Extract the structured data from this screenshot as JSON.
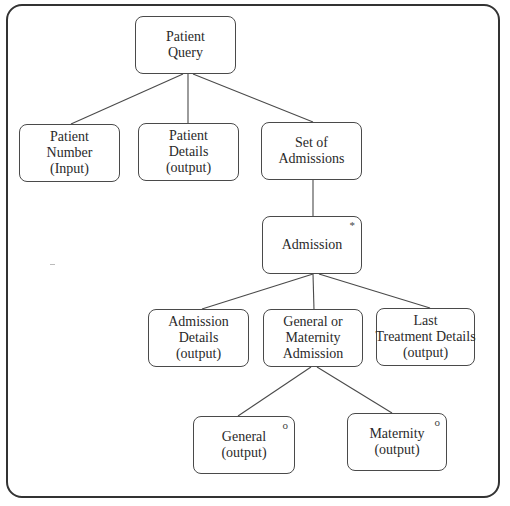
{
  "diagram": {
    "type": "jackson-structure-diagram",
    "nodes": [
      {
        "id": "patient_query",
        "lines": [
          "Patient",
          "Query"
        ],
        "marker": ""
      },
      {
        "id": "patient_number",
        "lines": [
          "Patient",
          "Number",
          "(Input)"
        ],
        "marker": ""
      },
      {
        "id": "patient_details",
        "lines": [
          "Patient",
          "Details",
          "(output)"
        ],
        "marker": ""
      },
      {
        "id": "set_of_admissions",
        "lines": [
          "Set of",
          "Admissions"
        ],
        "marker": ""
      },
      {
        "id": "admission",
        "lines": [
          "Admission"
        ],
        "marker": "*"
      },
      {
        "id": "admission_details",
        "lines": [
          "Admission",
          "Details",
          "(output)"
        ],
        "marker": ""
      },
      {
        "id": "general_or_maternity",
        "lines": [
          "General or",
          "Maternity",
          "Admission"
        ],
        "marker": ""
      },
      {
        "id": "last_treatment_details",
        "lines": [
          "Last",
          "Treatment Details",
          "(output)"
        ],
        "marker": ""
      },
      {
        "id": "general",
        "lines": [
          "General",
          "(output)"
        ],
        "marker": "o"
      },
      {
        "id": "maternity",
        "lines": [
          "Maternity",
          "(output)"
        ],
        "marker": "o"
      }
    ],
    "edges": [
      [
        "patient_query",
        "patient_number"
      ],
      [
        "patient_query",
        "patient_details"
      ],
      [
        "patient_query",
        "set_of_admissions"
      ],
      [
        "set_of_admissions",
        "admission"
      ],
      [
        "admission",
        "admission_details"
      ],
      [
        "admission",
        "general_or_maternity"
      ],
      [
        "admission",
        "last_treatment_details"
      ],
      [
        "general_or_maternity",
        "general"
      ],
      [
        "general_or_maternity",
        "maternity"
      ]
    ],
    "legend_markers": {
      "*": "iteration",
      "o": "selection"
    }
  }
}
